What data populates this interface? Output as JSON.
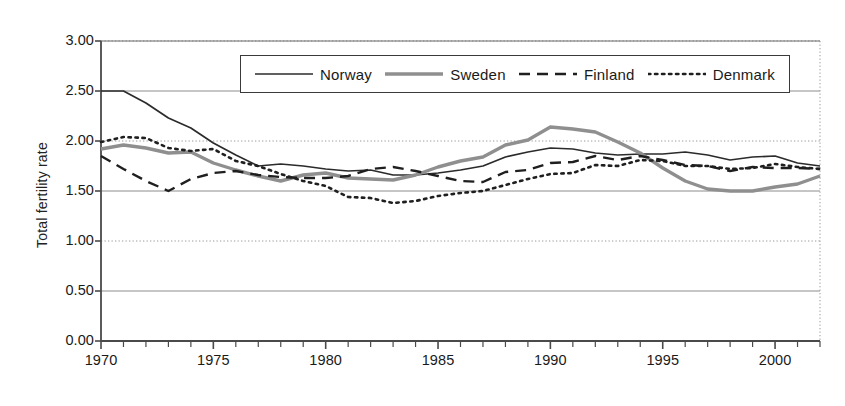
{
  "chart_data": {
    "type": "line",
    "title": "",
    "xlabel": "",
    "ylabel": "Total fertility rate",
    "xlim": [
      1970,
      2002
    ],
    "ylim": [
      0.0,
      3.0
    ],
    "yticks": [
      "0.00",
      "0.50",
      "1.00",
      "1.50",
      "2.00",
      "2.50",
      "3.00"
    ],
    "ytick_values": [
      0.0,
      0.5,
      1.0,
      1.5,
      2.0,
      2.5,
      3.0
    ],
    "xticks": [
      "1970",
      "1975",
      "1980",
      "1985",
      "1990",
      "1995",
      "2000"
    ],
    "xtick_values": [
      1970,
      1975,
      1980,
      1985,
      1990,
      1995,
      2000
    ],
    "x_minor_tick_step": 1,
    "grid": "horizontal",
    "legend_position": "top-center",
    "x": [
      1970,
      1971,
      1972,
      1973,
      1974,
      1975,
      1976,
      1977,
      1978,
      1979,
      1980,
      1981,
      1982,
      1983,
      1984,
      1985,
      1986,
      1987,
      1988,
      1989,
      1990,
      1991,
      1992,
      1993,
      1994,
      1995,
      1996,
      1997,
      1998,
      1999,
      2000,
      2001,
      2002
    ],
    "series": [
      {
        "name": "Norway",
        "style": "solid",
        "color": "#2b2b2b",
        "values": [
          2.5,
          2.5,
          2.38,
          2.23,
          2.13,
          1.98,
          1.86,
          1.75,
          1.77,
          1.75,
          1.72,
          1.7,
          1.71,
          1.66,
          1.66,
          1.68,
          1.71,
          1.75,
          1.84,
          1.89,
          1.93,
          1.92,
          1.88,
          1.86,
          1.87,
          1.87,
          1.89,
          1.86,
          1.81,
          1.84,
          1.85,
          1.78,
          1.75
        ]
      },
      {
        "name": "Sweden",
        "style": "thick-gray",
        "color": "#8f8f8f",
        "values": [
          1.92,
          1.96,
          1.93,
          1.88,
          1.89,
          1.78,
          1.71,
          1.65,
          1.6,
          1.66,
          1.68,
          1.63,
          1.62,
          1.61,
          1.66,
          1.74,
          1.8,
          1.84,
          1.96,
          2.01,
          2.14,
          2.12,
          2.09,
          1.99,
          1.88,
          1.73,
          1.6,
          1.52,
          1.5,
          1.5,
          1.54,
          1.57,
          1.65
        ]
      },
      {
        "name": "Finland",
        "style": "dashed",
        "color": "#1f1f1f",
        "values": [
          1.85,
          1.72,
          1.6,
          1.5,
          1.62,
          1.68,
          1.7,
          1.66,
          1.64,
          1.63,
          1.63,
          1.65,
          1.72,
          1.74,
          1.7,
          1.65,
          1.6,
          1.59,
          1.69,
          1.71,
          1.78,
          1.79,
          1.85,
          1.81,
          1.85,
          1.81,
          1.76,
          1.75,
          1.7,
          1.74,
          1.73,
          1.73,
          1.72
        ]
      },
      {
        "name": "Denmark",
        "style": "dotted",
        "color": "#1f1f1f",
        "values": [
          1.99,
          2.04,
          2.03,
          1.93,
          1.9,
          1.92,
          1.8,
          1.75,
          1.67,
          1.6,
          1.55,
          1.44,
          1.43,
          1.38,
          1.4,
          1.45,
          1.48,
          1.5,
          1.56,
          1.62,
          1.67,
          1.68,
          1.76,
          1.75,
          1.81,
          1.8,
          1.75,
          1.75,
          1.72,
          1.73,
          1.77,
          1.74,
          1.72
        ]
      }
    ]
  },
  "legend": {
    "items": [
      {
        "label": "Norway",
        "icon": "solid-line-icon"
      },
      {
        "label": "Sweden",
        "icon": "thick-gray-line-icon"
      },
      {
        "label": "Finland",
        "icon": "dashed-line-icon"
      },
      {
        "label": "Denmark",
        "icon": "dotted-line-icon"
      }
    ]
  }
}
